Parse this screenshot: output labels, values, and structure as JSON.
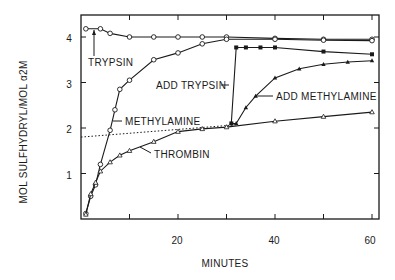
{
  "chart_data": {
    "type": "line",
    "title": "",
    "xlabel": "MINUTES",
    "ylabel": "MOL SULFHYDRYL/MOL α2M",
    "xlim": [
      0,
      62
    ],
    "ylim": [
      0,
      4.5
    ],
    "x_ticks": [
      10,
      20,
      30,
      40,
      50,
      60
    ],
    "x_tick_labels": [
      "",
      "20",
      "",
      "40",
      "",
      "60"
    ],
    "y_ticks": [
      1,
      2,
      3,
      4
    ],
    "y_tick_labels": [
      "1",
      "2",
      "3",
      "4"
    ],
    "grid": false,
    "legend": "none (inline annotations)",
    "series": [
      {
        "name": "TRYPSIN",
        "marker": "open-circle",
        "x": [
          1,
          4,
          6,
          10,
          15,
          20,
          25,
          30,
          40,
          50,
          60
        ],
        "y": [
          4.18,
          4.18,
          4.08,
          4.0,
          4.0,
          4.0,
          4.0,
          4.0,
          3.97,
          3.95,
          3.95
        ]
      },
      {
        "name": "METHYLAMINE",
        "marker": "open-circle",
        "x": [
          1,
          2,
          3,
          4,
          6,
          7,
          8,
          10,
          15,
          20,
          25,
          30,
          40,
          50,
          60
        ],
        "y": [
          0.12,
          0.5,
          0.75,
          1.2,
          1.95,
          2.4,
          2.85,
          3.05,
          3.5,
          3.65,
          3.85,
          3.95,
          3.95,
          3.93,
          3.92
        ]
      },
      {
        "name": "THROMBIN",
        "marker": "open-triangle",
        "x": [
          1,
          2,
          3,
          4,
          6,
          8,
          10,
          15,
          20,
          25,
          30,
          40,
          50,
          60
        ],
        "y": [
          0.1,
          0.55,
          0.8,
          1.05,
          1.25,
          1.4,
          1.5,
          1.7,
          1.92,
          1.98,
          2.02,
          2.15,
          2.25,
          2.35
        ]
      },
      {
        "name": "ADD TRYPSIN",
        "marker": "filled-square",
        "x": [
          31,
          32,
          34,
          37,
          40,
          50,
          60
        ],
        "y": [
          2.1,
          3.77,
          3.77,
          3.77,
          3.77,
          3.68,
          3.62
        ]
      },
      {
        "name": "ADD METHYLAMINE",
        "marker": "filled-triangle",
        "x": [
          31,
          32,
          34,
          36,
          40,
          45,
          50,
          55,
          60
        ],
        "y": [
          2.1,
          2.1,
          2.45,
          2.7,
          3.1,
          3.3,
          3.4,
          3.45,
          3.48
        ]
      },
      {
        "name": "baseline-extrapolation",
        "style": "dotted",
        "x": [
          0,
          32
        ],
        "y": [
          1.8,
          2.07
        ]
      }
    ],
    "annotations": [
      "TRYPSIN",
      "METHYLAMINE",
      "THROMBIN",
      "ADD TRYPSIN",
      "ADD METHYLAMINE"
    ]
  },
  "axes": {
    "xlabel": "MINUTES",
    "ylabel": "MOL SULFHYDRYL/MOL α2M",
    "x_tick_labels": [
      "20",
      "40",
      "60"
    ],
    "y_tick_labels": [
      "1",
      "2",
      "3",
      "4"
    ]
  },
  "annotations": {
    "trypsin": "TRYPSIN",
    "methylamine": "METHYLAMINE",
    "thrombin": "THROMBIN",
    "add_trypsin": "ADD TRYPSIN",
    "add_methylamine": "ADD METHYLAMINE"
  }
}
